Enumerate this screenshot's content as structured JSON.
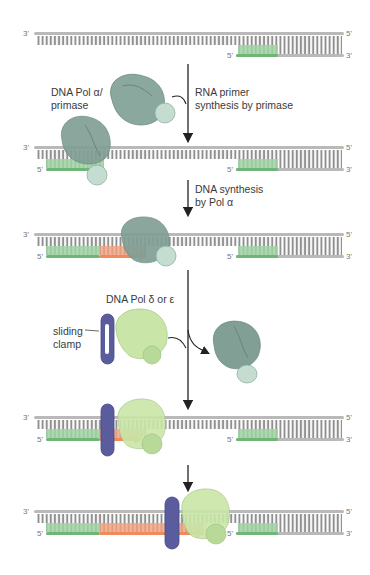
{
  "figure": {
    "colors": {
      "dna_backbone": "#b9b9b9",
      "dna_rungs": "#8f8f8f",
      "rna_primer": "#7cbf82",
      "new_dna": "#f08a5a",
      "pol_alpha_primase": "#7f9e94",
      "pol_alpha_small": "#b9d3c6",
      "pol_delta_epsilon": "#c9e6a8",
      "sliding_clamp": "#5a5c9e",
      "arrow": "#222222"
    },
    "strand_ends": {
      "top_left": "3'",
      "top_right": "5'",
      "bottom_left": "5'",
      "bottom_right": "3'"
    },
    "labels": {
      "pol_alpha": "DNA Pol α/",
      "primase": "primase",
      "step1_line1": "RNA primer",
      "step1_line2": "synthesis by primase",
      "step2_line1": "DNA synthesis",
      "step2_line2": "by Pol α",
      "pol_delta": "DNA Pol δ or ε",
      "clamp_line1": "sliding",
      "clamp_line2": "clamp"
    },
    "stages": [
      {
        "index": 1,
        "description": "Template with existing primer at right"
      },
      {
        "index": 2,
        "description": "Primase synthesizes RNA primer at left"
      },
      {
        "index": 3,
        "description": "Pol alpha extends primer with DNA"
      },
      {
        "index": 4,
        "description": "Clamp loaded; Pol delta/epsilon binds"
      },
      {
        "index": 5,
        "description": "Processive synthesis by Pol delta/epsilon"
      }
    ]
  }
}
